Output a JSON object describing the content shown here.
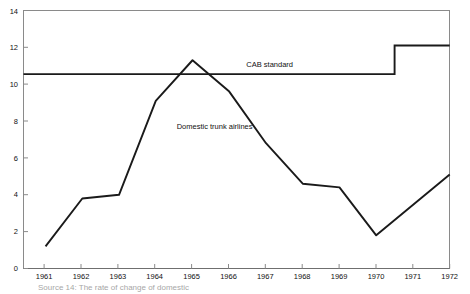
{
  "chart_data": {
    "type": "line",
    "title": "",
    "xlabel": "",
    "ylabel": "",
    "xlim": [
      1960.4,
      1972.0
    ],
    "ylim": [
      0,
      14
    ],
    "grid": false,
    "legend": "inline-annotations",
    "x_tick_labels": [
      "1961",
      "1962",
      "1963",
      "1964",
      "1965",
      "1966",
      "1967",
      "1968",
      "1969",
      "1970",
      "1971",
      "1972"
    ],
    "y_tick_labels": [
      "0",
      "2",
      "4",
      "6",
      "8",
      "10",
      "12",
      "14"
    ],
    "y_ticks": [
      0,
      2,
      4,
      6,
      8,
      10,
      12,
      14
    ],
    "x": [
      1961,
      1962,
      1963,
      1964,
      1965,
      1966,
      1967,
      1968,
      1969,
      1970,
      1972
    ],
    "series": [
      {
        "name": "Domestic trunk airlines",
        "label": "Domestic trunk airlines",
        "values": [
          1.2,
          3.8,
          4.0,
          9.1,
          11.3,
          9.6,
          6.8,
          4.6,
          4.4,
          1.8,
          5.1
        ]
      },
      {
        "name": "CAB standard",
        "label": "CAB standard",
        "type": "step",
        "x": [
          1960.4,
          1970.5,
          1970.5,
          1972.0
        ],
        "values": [
          10.55,
          10.55,
          12.1,
          12.1
        ]
      }
    ],
    "annotations": [
      {
        "text": "CAB standard",
        "x": 1967.1,
        "y": 10.95
      },
      {
        "text": "Domestic trunk airlines",
        "x": 1965.6,
        "y": 7.55
      }
    ]
  },
  "caption": {
    "text": "Source 14:  The rate of change of domestic"
  },
  "colors": {
    "background": "#ffffff",
    "axis": "#777777",
    "series_line": "#1a1a1a",
    "standard_line": "#1a1a1a",
    "text": "#111111"
  }
}
